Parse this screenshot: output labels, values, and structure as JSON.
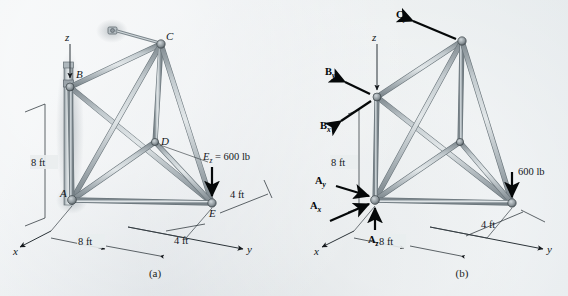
{
  "figure": {
    "kind": "engineering-statics-space-truss",
    "captions": {
      "a": "(a)",
      "b": "(b)"
    }
  },
  "panel_a": {
    "caption": "(a)",
    "axes": {
      "x": "x",
      "y": "y",
      "z": "z"
    },
    "joints": [
      {
        "id": "A",
        "label": "A"
      },
      {
        "id": "B",
        "label": "B"
      },
      {
        "id": "C",
        "label": "C"
      },
      {
        "id": "D",
        "label": "D"
      },
      {
        "id": "E",
        "label": "E"
      }
    ],
    "load": {
      "symbol": "E",
      "subscript": "z",
      "equals": " = ",
      "value": "600 lb",
      "full_label": "Ez = 600 lb"
    },
    "dimensions": [
      {
        "name": "height-ab",
        "text": "8 ft"
      },
      {
        "name": "span-y",
        "text": "8 ft"
      },
      {
        "name": "offset-y-near",
        "text": "4 ft"
      },
      {
        "name": "offset-x",
        "text": "4 ft"
      }
    ]
  },
  "panel_b": {
    "caption": "(b)",
    "axes": {
      "x": "x",
      "y": "y",
      "z": "z"
    },
    "reactions": [
      {
        "name": "B-y",
        "symbol": "B",
        "subscript": "y"
      },
      {
        "name": "B-x",
        "symbol": "B",
        "subscript": "x"
      },
      {
        "name": "C-y",
        "symbol": "C",
        "subscript": "y"
      },
      {
        "name": "A-y",
        "symbol": "A",
        "subscript": "y"
      },
      {
        "name": "A-x",
        "symbol": "A",
        "subscript": "x"
      },
      {
        "name": "A-z",
        "symbol": "A",
        "subscript": "z"
      }
    ],
    "load": {
      "value": "600 lb"
    },
    "dimensions": [
      {
        "name": "height-ab",
        "text": "8 ft"
      },
      {
        "name": "span-y",
        "text": "8 ft"
      },
      {
        "name": "offset-y-near",
        "text": "4 ft"
      }
    ]
  },
  "colors": {
    "paper": "#e8ecee",
    "member_edge": "#6f7a80",
    "member_fill": "#b9c2c6",
    "member_high": "#e3e8ea",
    "ink": "#14181c",
    "arrow": "#050809"
  }
}
